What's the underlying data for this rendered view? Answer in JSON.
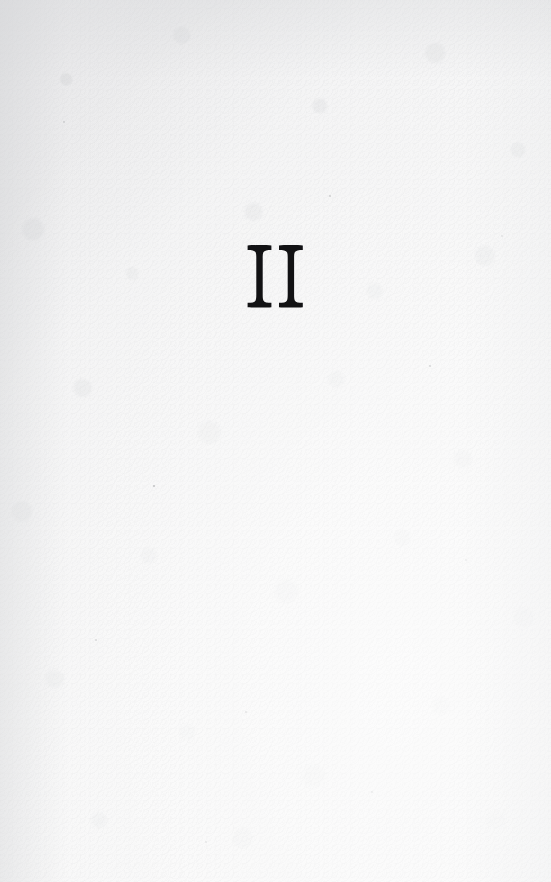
{
  "document": {
    "kind": "scanned-book-page",
    "page_type": "part-title-page",
    "page_width": 551,
    "page_height": 882
  },
  "page": {
    "numeral": "II",
    "numeral_reading": "two",
    "numeral_system": "roman",
    "numeral_center_x": 256,
    "numeral_top_y": 245,
    "numeral_bottom_y": 306,
    "numeral_left_x": 228,
    "numeral_right_x": 284,
    "numeral_height_px": 61,
    "numeral_width_px": 56,
    "body_text": "",
    "running_head": "",
    "folio": "",
    "footnote": ""
  },
  "colors": {
    "ink": "#121214",
    "paper_light": "#fbfbfb",
    "paper_mid": "#f4f4f5",
    "paper_shadow": "#dcdde0",
    "speck": "#8a8c90"
  },
  "icons": {
    "numeral_glyph": "roman-numeral-two-glyph"
  }
}
